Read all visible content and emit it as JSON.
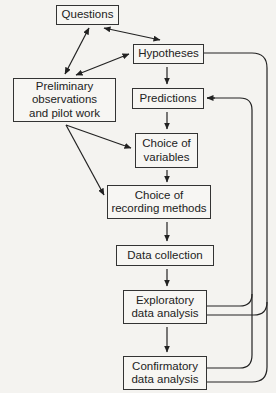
{
  "diagram": {
    "type": "flowchart",
    "nodes": {
      "questions": "Questions",
      "hypotheses": "Hypotheses",
      "preliminary": "Preliminary\nobservations\nand pilot work",
      "predictions": "Predictions",
      "variables": "Choice of\nvariables",
      "recording": "Choice of\nrecording methods",
      "collection": "Data collection",
      "exploratory": "Exploratory\ndata analysis",
      "confirmatory": "Confirmatory\ndata analysis"
    },
    "edges": [
      {
        "from": "questions",
        "to": "hypotheses",
        "bidirectional": true
      },
      {
        "from": "questions",
        "to": "preliminary",
        "bidirectional": true
      },
      {
        "from": "hypotheses",
        "to": "preliminary",
        "bidirectional": true
      },
      {
        "from": "hypotheses",
        "to": "predictions"
      },
      {
        "from": "predictions",
        "to": "variables"
      },
      {
        "from": "preliminary",
        "to": "variables"
      },
      {
        "from": "preliminary",
        "to": "recording"
      },
      {
        "from": "variables",
        "to": "recording"
      },
      {
        "from": "recording",
        "to": "collection"
      },
      {
        "from": "collection",
        "to": "exploratory"
      },
      {
        "from": "exploratory",
        "to": "confirmatory"
      },
      {
        "from": "exploratory",
        "to": "predictions",
        "feedback": true
      },
      {
        "from": "confirmatory",
        "to": "predictions",
        "feedback": true
      },
      {
        "from": "exploratory",
        "to": "hypotheses",
        "feedback": true
      },
      {
        "from": "confirmatory",
        "to": "hypotheses",
        "feedback": true
      }
    ]
  }
}
